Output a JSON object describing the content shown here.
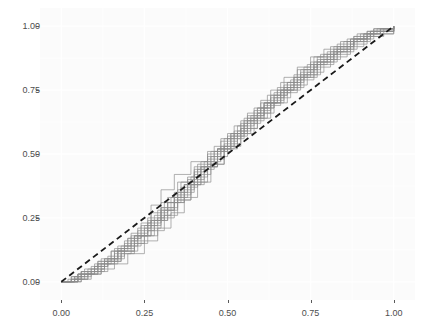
{
  "chart_data": {
    "type": "line",
    "title": "",
    "subtitle": "",
    "xlabel": "",
    "ylabel": "",
    "xlim": [
      -0.04,
      1.04
    ],
    "ylim": [
      -0.04,
      1.04
    ],
    "grid": true,
    "legend": null,
    "legend_position": "none",
    "x_ticks": [
      0.0,
      0.25,
      0.5,
      0.75,
      1.0
    ],
    "x_tick_labels": [
      "0.00",
      "0.25",
      "0.50",
      "0.75",
      "1.00"
    ],
    "y_ticks": [
      0.0,
      0.25,
      0.5,
      0.75,
      1.0
    ],
    "y_tick_labels": [
      "0.00",
      "0.25",
      "0.50",
      "0.75",
      "1.00"
    ],
    "panel_background": "#fbfbfb",
    "grid_color": "#ffffff",
    "series_color": "#8c8c8c",
    "reference_color": "#1a1a1a",
    "annotations": [],
    "reference_line": {
      "name": "uniform-cdf-reference",
      "style": "dashed",
      "x": [
        0.0,
        1.0
      ],
      "y": [
        0.0,
        1.0
      ]
    },
    "series": [
      {
        "name": "ecdf-01",
        "x": [
          0.0,
          0.03,
          0.06,
          0.1,
          0.14,
          0.19,
          0.24,
          0.28,
          0.31,
          0.34,
          0.37,
          0.4,
          0.44,
          0.48,
          0.52,
          0.56,
          0.6,
          0.63,
          0.67,
          0.71,
          0.75,
          0.79,
          0.84,
          0.89,
          0.94,
          1.0
        ],
        "y": [
          0.0,
          0.02,
          0.04,
          0.06,
          0.09,
          0.14,
          0.18,
          0.24,
          0.28,
          0.33,
          0.38,
          0.44,
          0.5,
          0.56,
          0.61,
          0.66,
          0.71,
          0.75,
          0.8,
          0.84,
          0.88,
          0.91,
          0.94,
          0.97,
          0.99,
          1.0
        ]
      },
      {
        "name": "ecdf-02",
        "x": [
          0.0,
          0.04,
          0.08,
          0.12,
          0.16,
          0.2,
          0.25,
          0.29,
          0.33,
          0.37,
          0.41,
          0.45,
          0.49,
          0.53,
          0.57,
          0.61,
          0.65,
          0.7,
          0.74,
          0.78,
          0.83,
          0.88,
          0.93,
          1.0
        ],
        "y": [
          0.0,
          0.01,
          0.03,
          0.05,
          0.07,
          0.11,
          0.16,
          0.21,
          0.27,
          0.33,
          0.39,
          0.46,
          0.53,
          0.59,
          0.65,
          0.7,
          0.75,
          0.8,
          0.85,
          0.89,
          0.93,
          0.96,
          0.98,
          1.0
        ]
      },
      {
        "name": "ecdf-03",
        "x": [
          0.0,
          0.05,
          0.09,
          0.13,
          0.17,
          0.21,
          0.26,
          0.3,
          0.34,
          0.38,
          0.42,
          0.46,
          0.5,
          0.54,
          0.58,
          0.62,
          0.66,
          0.71,
          0.76,
          0.81,
          0.86,
          0.91,
          0.96,
          1.0
        ],
        "y": [
          0.0,
          0.03,
          0.06,
          0.09,
          0.13,
          0.18,
          0.23,
          0.29,
          0.35,
          0.41,
          0.47,
          0.53,
          0.58,
          0.63,
          0.68,
          0.73,
          0.78,
          0.83,
          0.88,
          0.92,
          0.95,
          0.97,
          0.99,
          1.0
        ]
      },
      {
        "name": "ecdf-04",
        "x": [
          0.0,
          0.03,
          0.07,
          0.11,
          0.15,
          0.2,
          0.24,
          0.27,
          0.3,
          0.34,
          0.39,
          0.44,
          0.49,
          0.54,
          0.59,
          0.64,
          0.69,
          0.73,
          0.77,
          0.82,
          0.87,
          0.92,
          1.0
        ],
        "y": [
          0.0,
          0.02,
          0.05,
          0.08,
          0.12,
          0.17,
          0.23,
          0.3,
          0.36,
          0.42,
          0.47,
          0.51,
          0.56,
          0.62,
          0.68,
          0.74,
          0.79,
          0.84,
          0.88,
          0.92,
          0.95,
          0.98,
          1.0
        ]
      },
      {
        "name": "ecdf-05",
        "x": [
          0.0,
          0.04,
          0.09,
          0.14,
          0.18,
          0.22,
          0.26,
          0.31,
          0.35,
          0.39,
          0.43,
          0.47,
          0.51,
          0.55,
          0.6,
          0.65,
          0.7,
          0.75,
          0.8,
          0.85,
          0.9,
          0.95,
          1.0
        ],
        "y": [
          0.0,
          0.01,
          0.04,
          0.08,
          0.11,
          0.15,
          0.2,
          0.26,
          0.32,
          0.38,
          0.45,
          0.52,
          0.58,
          0.64,
          0.7,
          0.76,
          0.81,
          0.86,
          0.9,
          0.94,
          0.97,
          0.99,
          1.0
        ]
      },
      {
        "name": "ecdf-06",
        "x": [
          0.0,
          0.05,
          0.1,
          0.15,
          0.19,
          0.23,
          0.27,
          0.32,
          0.36,
          0.4,
          0.45,
          0.5,
          0.55,
          0.59,
          0.63,
          0.68,
          0.72,
          0.77,
          0.82,
          0.87,
          0.92,
          1.0
        ],
        "y": [
          0.0,
          0.03,
          0.07,
          0.12,
          0.16,
          0.21,
          0.27,
          0.33,
          0.39,
          0.45,
          0.51,
          0.57,
          0.63,
          0.68,
          0.73,
          0.78,
          0.83,
          0.87,
          0.91,
          0.95,
          0.98,
          1.0
        ]
      },
      {
        "name": "ecdf-07",
        "x": [
          0.0,
          0.02,
          0.06,
          0.11,
          0.16,
          0.21,
          0.25,
          0.3,
          0.35,
          0.4,
          0.44,
          0.48,
          0.53,
          0.58,
          0.63,
          0.67,
          0.72,
          0.76,
          0.81,
          0.86,
          0.91,
          0.96,
          1.0
        ],
        "y": [
          0.0,
          0.01,
          0.03,
          0.07,
          0.11,
          0.16,
          0.22,
          0.29,
          0.36,
          0.43,
          0.49,
          0.55,
          0.61,
          0.67,
          0.72,
          0.77,
          0.82,
          0.86,
          0.9,
          0.94,
          0.97,
          0.99,
          1.0
        ]
      },
      {
        "name": "ecdf-08",
        "x": [
          0.0,
          0.04,
          0.08,
          0.13,
          0.18,
          0.23,
          0.28,
          0.33,
          0.38,
          0.43,
          0.48,
          0.52,
          0.56,
          0.61,
          0.66,
          0.71,
          0.76,
          0.8,
          0.84,
          0.88,
          0.93,
          1.0
        ],
        "y": [
          0.0,
          0.02,
          0.05,
          0.09,
          0.14,
          0.2,
          0.26,
          0.33,
          0.4,
          0.47,
          0.53,
          0.59,
          0.65,
          0.7,
          0.75,
          0.8,
          0.85,
          0.89,
          0.92,
          0.95,
          0.98,
          1.0
        ]
      },
      {
        "name": "ecdf-09",
        "x": [
          0.0,
          0.06,
          0.11,
          0.16,
          0.2,
          0.24,
          0.29,
          0.34,
          0.39,
          0.44,
          0.49,
          0.54,
          0.59,
          0.64,
          0.69,
          0.74,
          0.79,
          0.84,
          0.89,
          0.94,
          1.0
        ],
        "y": [
          0.0,
          0.04,
          0.08,
          0.13,
          0.17,
          0.22,
          0.28,
          0.34,
          0.41,
          0.48,
          0.54,
          0.6,
          0.66,
          0.72,
          0.77,
          0.82,
          0.87,
          0.91,
          0.95,
          0.98,
          1.0
        ]
      },
      {
        "name": "ecdf-10",
        "x": [
          0.0,
          0.03,
          0.08,
          0.13,
          0.17,
          0.22,
          0.27,
          0.32,
          0.37,
          0.42,
          0.47,
          0.51,
          0.56,
          0.61,
          0.66,
          0.7,
          0.75,
          0.79,
          0.83,
          0.88,
          0.94,
          1.0
        ],
        "y": [
          0.0,
          0.01,
          0.04,
          0.08,
          0.12,
          0.18,
          0.24,
          0.31,
          0.38,
          0.45,
          0.52,
          0.58,
          0.64,
          0.7,
          0.75,
          0.8,
          0.85,
          0.89,
          0.92,
          0.96,
          0.99,
          1.0
        ]
      },
      {
        "name": "ecdf-11",
        "x": [
          0.0,
          0.05,
          0.1,
          0.14,
          0.19,
          0.25,
          0.3,
          0.35,
          0.4,
          0.45,
          0.5,
          0.55,
          0.6,
          0.64,
          0.68,
          0.73,
          0.78,
          0.83,
          0.88,
          0.93,
          1.0
        ],
        "y": [
          0.0,
          0.03,
          0.06,
          0.1,
          0.15,
          0.21,
          0.28,
          0.35,
          0.42,
          0.49,
          0.56,
          0.62,
          0.68,
          0.73,
          0.78,
          0.83,
          0.87,
          0.91,
          0.95,
          0.98,
          1.0
        ]
      },
      {
        "name": "ecdf-12",
        "x": [
          0.0,
          0.04,
          0.09,
          0.13,
          0.18,
          0.22,
          0.26,
          0.3,
          0.35,
          0.41,
          0.47,
          0.53,
          0.58,
          0.63,
          0.68,
          0.73,
          0.78,
          0.83,
          0.88,
          0.93,
          1.0
        ],
        "y": [
          0.0,
          0.02,
          0.05,
          0.08,
          0.13,
          0.18,
          0.24,
          0.31,
          0.39,
          0.46,
          0.52,
          0.58,
          0.64,
          0.7,
          0.76,
          0.81,
          0.86,
          0.9,
          0.94,
          0.97,
          1.0
        ]
      },
      {
        "name": "ecdf-13",
        "x": [
          0.0,
          0.06,
          0.12,
          0.17,
          0.21,
          0.26,
          0.31,
          0.36,
          0.41,
          0.46,
          0.51,
          0.56,
          0.61,
          0.66,
          0.71,
          0.76,
          0.81,
          0.86,
          0.91,
          0.96,
          1.0
        ],
        "y": [
          0.0,
          0.04,
          0.09,
          0.14,
          0.19,
          0.25,
          0.31,
          0.37,
          0.44,
          0.51,
          0.57,
          0.63,
          0.69,
          0.74,
          0.79,
          0.84,
          0.88,
          0.92,
          0.96,
          0.99,
          1.0
        ]
      },
      {
        "name": "ecdf-14",
        "x": [
          0.0,
          0.03,
          0.07,
          0.12,
          0.17,
          0.23,
          0.29,
          0.34,
          0.39,
          0.44,
          0.49,
          0.54,
          0.59,
          0.63,
          0.67,
          0.72,
          0.77,
          0.82,
          0.87,
          0.92,
          1.0
        ],
        "y": [
          0.0,
          0.01,
          0.03,
          0.07,
          0.12,
          0.18,
          0.25,
          0.32,
          0.39,
          0.46,
          0.53,
          0.6,
          0.66,
          0.71,
          0.76,
          0.81,
          0.86,
          0.9,
          0.94,
          0.97,
          1.0
        ]
      },
      {
        "name": "ecdf-15",
        "x": [
          0.0,
          0.05,
          0.11,
          0.16,
          0.22,
          0.27,
          0.32,
          0.37,
          0.42,
          0.47,
          0.52,
          0.57,
          0.62,
          0.67,
          0.72,
          0.77,
          0.82,
          0.87,
          0.92,
          0.97,
          1.0
        ],
        "y": [
          0.0,
          0.03,
          0.07,
          0.12,
          0.18,
          0.24,
          0.31,
          0.38,
          0.45,
          0.52,
          0.58,
          0.64,
          0.7,
          0.75,
          0.8,
          0.85,
          0.89,
          0.93,
          0.96,
          0.99,
          1.0
        ]
      }
    ]
  }
}
